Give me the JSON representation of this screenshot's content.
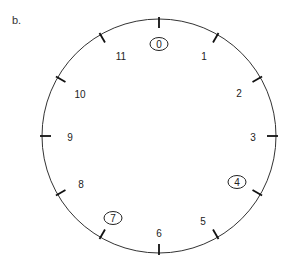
{
  "figure_label": "b.",
  "clock": {
    "center": [
      159,
      136
    ],
    "radius": 117,
    "circle_color": "#333333",
    "numbers": [
      {
        "label": "0",
        "x": 159,
        "y": 44,
        "circled": true
      },
      {
        "label": "1",
        "x": 204,
        "y": 56,
        "circled": false
      },
      {
        "label": "2",
        "x": 239,
        "y": 93,
        "circled": false
      },
      {
        "label": "3",
        "x": 253,
        "y": 137,
        "circled": false
      },
      {
        "label": "4",
        "x": 237,
        "y": 182,
        "circled": true
      },
      {
        "label": "5",
        "x": 203,
        "y": 221,
        "circled": false
      },
      {
        "label": "6",
        "x": 159,
        "y": 233,
        "circled": false
      },
      {
        "label": "7",
        "x": 113,
        "y": 218,
        "circled": true
      },
      {
        "label": "8",
        "x": 81,
        "y": 184,
        "circled": false
      },
      {
        "label": "9",
        "x": 70,
        "y": 137,
        "circled": false
      },
      {
        "label": "10",
        "x": 80,
        "y": 94,
        "circled": false
      },
      {
        "label": "11",
        "x": 121,
        "y": 56,
        "circled": false
      }
    ],
    "tick_count": 12
  }
}
